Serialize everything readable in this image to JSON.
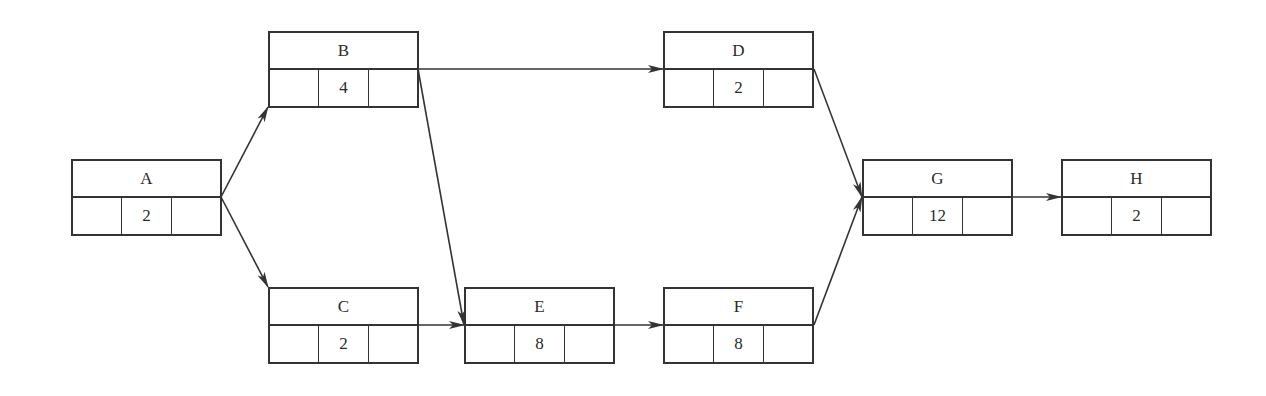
{
  "diagram": {
    "type": "activity-on-node network",
    "colors": {
      "line": "#333333",
      "text": "#2a2a2a",
      "background": "#ffffff"
    },
    "nodes": [
      {
        "id": "A",
        "label": "A",
        "duration": "2",
        "x": 71,
        "y": 159
      },
      {
        "id": "B",
        "label": "B",
        "duration": "4",
        "x": 268,
        "y": 31
      },
      {
        "id": "C",
        "label": "C",
        "duration": "2",
        "x": 268,
        "y": 287
      },
      {
        "id": "D",
        "label": "D",
        "duration": "2",
        "x": 663,
        "y": 31
      },
      {
        "id": "E",
        "label": "E",
        "duration": "8",
        "x": 464,
        "y": 287
      },
      {
        "id": "F",
        "label": "F",
        "duration": "8",
        "x": 663,
        "y": 287
      },
      {
        "id": "G",
        "label": "G",
        "duration": "12",
        "x": 862,
        "y": 159
      },
      {
        "id": "H",
        "label": "H",
        "duration": "2",
        "x": 1061,
        "y": 159
      }
    ],
    "edges": [
      {
        "from": "A",
        "to": "B",
        "x1": 221,
        "y1": 197,
        "x2": 268,
        "y2": 107
      },
      {
        "from": "A",
        "to": "C",
        "x1": 221,
        "y1": 197,
        "x2": 268,
        "y2": 287
      },
      {
        "from": "B",
        "to": "D",
        "x1": 418,
        "y1": 69,
        "x2": 663,
        "y2": 69
      },
      {
        "from": "B",
        "to": "E",
        "x1": 418,
        "y1": 69,
        "x2": 464,
        "y2": 325
      },
      {
        "from": "C",
        "to": "E",
        "x1": 418,
        "y1": 325,
        "x2": 464,
        "y2": 325
      },
      {
        "from": "E",
        "to": "F",
        "x1": 615,
        "y1": 325,
        "x2": 663,
        "y2": 325
      },
      {
        "from": "D",
        "to": "G",
        "x1": 814,
        "y1": 69,
        "x2": 862,
        "y2": 197
      },
      {
        "from": "F",
        "to": "G",
        "x1": 814,
        "y1": 325,
        "x2": 862,
        "y2": 197
      },
      {
        "from": "G",
        "to": "H",
        "x1": 1013,
        "y1": 197,
        "x2": 1061,
        "y2": 197
      }
    ]
  }
}
